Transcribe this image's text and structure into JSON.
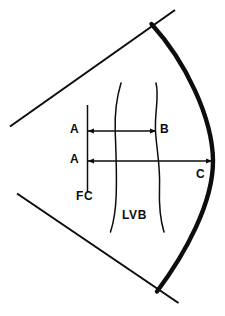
{
  "figure": {
    "background_color": "#ffffff",
    "stroke_color": "#0d0d0d",
    "labels": {
      "a_upper": "A",
      "a_lower": "A",
      "b": "B",
      "c": "C",
      "fc": "FC",
      "lvb": "LVB"
    },
    "geometry": {
      "sector_upper_edge": "thin straight line from (10,126) to (175,10)",
      "sector_lower_edge": "thin straight line from (17,194) to (178,303)",
      "arc": "thick convex arc from (152,24) through (213,160) to (157,291)",
      "fc_line": "thin vertical line at x=87 from y=105 to y=192",
      "lvb_left_curve": "wavy vertical curve near x=117 from y=83 to y=232",
      "lvb_right_curve": "wavy vertical curve near x=157 from y=83 to y=232",
      "arrow_ab": "double-headed horizontal arrow at y=131 from x=88 to x=156",
      "arrow_ac": "double-headed horizontal arrow at y=161 from x=88 to x=212"
    }
  }
}
